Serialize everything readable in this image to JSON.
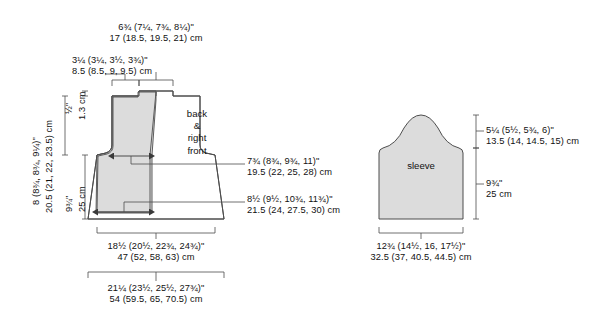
{
  "figure": {
    "type": "knitting-pattern-schematic",
    "units": [
      "inches",
      "cm"
    ],
    "size_count": 4,
    "line_color": "#4d4d4d",
    "fill_color": "#dcdcdc",
    "background": "#ffffff"
  },
  "pieces": {
    "body": {
      "name_line1": "back",
      "name_line2": "&",
      "name_line3": "right",
      "name_line4": "front"
    },
    "sleeve": {
      "name": "sleeve"
    }
  },
  "measurements": {
    "neck_width": {
      "imperial": "6¾ (7¼, 7¾, 8¼)\"",
      "metric": "17 (18.5, 19.5, 21) cm"
    },
    "shoulder_width": {
      "imperial": "3¼ (3¼, 3½, 3¾)\"",
      "metric": "8.5 (8.5, 9, 9.5) cm"
    },
    "neck_depth": {
      "imperial": "½\"",
      "metric": "1.3 cm"
    },
    "armhole_depth": {
      "imperial": "8 (8¾, 8¾, 9¼)\"",
      "metric": "20.5 (21, 22, 23.5) cm"
    },
    "body_length": {
      "imperial": "9¾\"",
      "metric": "25 cm"
    },
    "upper_front_width": {
      "imperial": "7¾ (8¾, 9¾, 11)\"",
      "metric": "19.5 (22, 25, 28) cm"
    },
    "lower_front_width": {
      "imperial": "8½ (9½, 10¾, 11¾)\"",
      "metric": "21.5 (24, 27.5, 30) cm"
    },
    "upper_body_width": {
      "imperial": "18½ (20½, 22¾, 24¾)\"",
      "metric": "47 (52, 58, 63) cm"
    },
    "lower_body_width": {
      "imperial": "21¼ (23½, 25½, 27¾)\"",
      "metric": "54 (59.5, 65, 70.5) cm"
    },
    "sleeve_cap_height": {
      "imperial": "5¼ (5½, 5¾, 6)\"",
      "metric": "13.5 (14, 14.5, 15) cm"
    },
    "sleeve_length": {
      "imperial": "9¾\"",
      "metric": "25 cm"
    },
    "sleeve_width": {
      "imperial": "12¾ (14½, 16, 17½)\"",
      "metric": "32.5 (37, 40.5, 44.5) cm"
    }
  }
}
